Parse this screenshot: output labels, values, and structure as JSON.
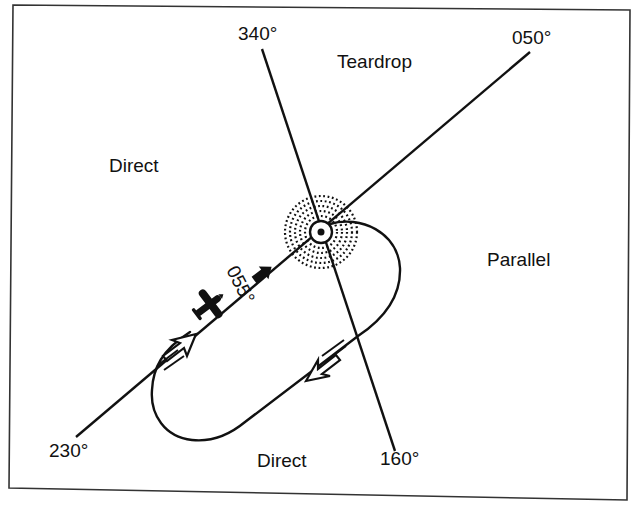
{
  "diagram": {
    "type": "holding-pattern-entry",
    "colors": {
      "ink": "#111111",
      "background": "#ffffff",
      "frame": "#333333"
    },
    "radials": {
      "r340": "340°",
      "r050": "050°",
      "r230": "230°",
      "r160": "160°"
    },
    "sectors": {
      "teardrop": "Teardrop",
      "direct_left": "Direct",
      "parallel": "Parallel",
      "direct_bottom": "Direct"
    },
    "aircraft_heading": "055°",
    "icons": {
      "fix": "holding-fix-icon",
      "aircraft": "airplane-icon",
      "heading_arrow": "heading-arrow-icon",
      "inbound_arrow": "inbound-arrow-icon",
      "outbound_arrow": "outbound-arrow-icon"
    }
  }
}
